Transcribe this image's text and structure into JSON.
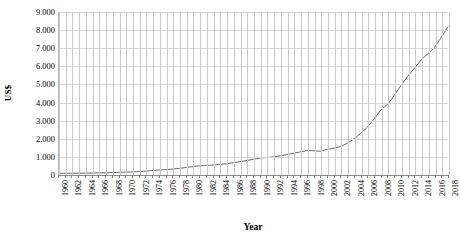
{
  "chart_data": {
    "type": "line",
    "title": "",
    "xlabel": "Year",
    "ylabel": "US$",
    "grid": true,
    "legend": "none",
    "xlim": [
      1960,
      2018
    ],
    "ylim": [
      0,
      9000
    ],
    "ytick_labels": [
      "9.000",
      "8.000",
      "7.000",
      "6.000",
      "5.000",
      "4.000",
      "3.000",
      "2.000",
      "1.000",
      "0"
    ],
    "ytick_values": [
      9000,
      8000,
      7000,
      6000,
      5000,
      4000,
      3000,
      2000,
      1000,
      0
    ],
    "xtick_labels": [
      "1960",
      "1962",
      "1964",
      "1966",
      "1968",
      "1970",
      "1972",
      "1974",
      "1976",
      "1978",
      "1980",
      "1982",
      "1984",
      "1986",
      "1988",
      "1990",
      "1992",
      "1994",
      "1996",
      "1998",
      "2000",
      "2002",
      "2004",
      "2006",
      "2008",
      "2010",
      "2012",
      "2014",
      "2016",
      "2018"
    ],
    "series": [
      {
        "name": "US$ per capita",
        "color": "#6b6b6b",
        "x": [
          1960,
          1961,
          1962,
          1963,
          1964,
          1965,
          1966,
          1967,
          1968,
          1969,
          1970,
          1971,
          1972,
          1973,
          1974,
          1975,
          1976,
          1977,
          1978,
          1979,
          1980,
          1981,
          1982,
          1983,
          1984,
          1985,
          1986,
          1987,
          1988,
          1989,
          1990,
          1991,
          1992,
          1993,
          1994,
          1995,
          1996,
          1997,
          1998,
          1999,
          2000,
          2001,
          2002,
          2003,
          2004,
          2005,
          2006,
          2007,
          2008,
          2009,
          2010,
          2011,
          2012,
          2013,
          2014,
          2015,
          2016,
          2017,
          2018
        ],
        "values": [
          90,
          92,
          96,
          100,
          105,
          110,
          118,
          125,
          135,
          148,
          162,
          175,
          192,
          215,
          250,
          275,
          300,
          330,
          370,
          415,
          470,
          505,
          530,
          550,
          580,
          620,
          680,
          740,
          800,
          870,
          940,
          960,
          1000,
          1060,
          1130,
          1200,
          1280,
          1350,
          1340,
          1310,
          1420,
          1480,
          1580,
          1750,
          2000,
          2300,
          2650,
          3100,
          3600,
          3900,
          4400,
          4950,
          5450,
          5900,
          6350,
          6700,
          7050,
          7600,
          8200
        ]
      }
    ]
  }
}
